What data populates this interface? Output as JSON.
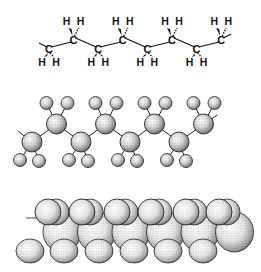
{
  "diagram": {
    "panels": [
      {
        "id": "structural",
        "kind": "structural-formula",
        "carbon_label": "C",
        "hydrogen_label": "H",
        "carbon_count": 8
      },
      {
        "id": "ballstick",
        "kind": "ball-and-stick-model",
        "carbon_count": 8
      },
      {
        "id": "spacefill",
        "kind": "space-filling-model"
      }
    ],
    "colors": {
      "ink": "#111111",
      "background": "#ffffff",
      "sphere_light": "#f4f4f4",
      "sphere_dark": "#555555"
    }
  }
}
